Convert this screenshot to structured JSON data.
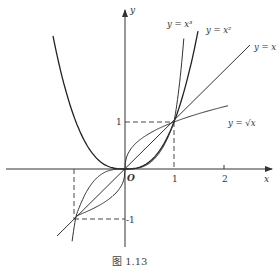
{
  "figure": {
    "caption": "图 1.13",
    "origin_label": "O",
    "x_axis_label": "x",
    "y_axis_label": "y",
    "x_ticks": [
      {
        "value": 1,
        "label": "1"
      },
      {
        "value": 2,
        "label": "2"
      }
    ],
    "y_ticks": [
      {
        "value": 1,
        "label": "1"
      },
      {
        "value": -1,
        "label": "-1"
      }
    ],
    "curves": [
      {
        "name": "y = x³",
        "label": "y = x³"
      },
      {
        "name": "y = x²",
        "label": "y = x²"
      },
      {
        "name": "y = x",
        "label": "y = x"
      },
      {
        "name": "y = √x",
        "label": "y = √x"
      }
    ],
    "reference_points": [
      {
        "x": 1,
        "y": 1
      },
      {
        "x": -1,
        "y": -1
      }
    ]
  },
  "colors": {
    "stroke": "#333333",
    "background": "#ffffff"
  }
}
